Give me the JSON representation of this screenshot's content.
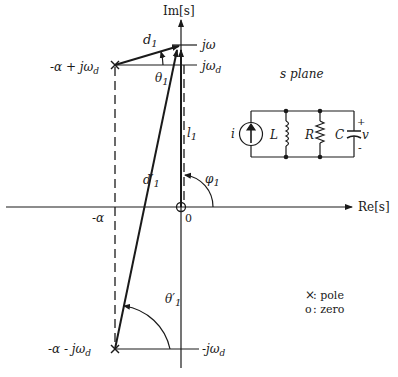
{
  "axes": {
    "imaginary_label": "Im[s]",
    "real_label": "Re[s]",
    "origin_label": "0"
  },
  "plane_title": "s plane",
  "points": {
    "j_omega": "jω",
    "j_omega_d": "jω",
    "j_omega_d_sub": "d",
    "neg_j_omega_d": "-jω",
    "neg_j_omega_d_sub": "d",
    "upper_pole": "-α + jω",
    "upper_pole_sub": "d",
    "lower_pole": "-α - jω",
    "lower_pole_sub": "d",
    "neg_alpha": "-α"
  },
  "vectors": {
    "d1": "d",
    "d1_sub": "1",
    "d1_prime": "d′",
    "d1_prime_sub": "1",
    "l1": "l",
    "l1_sub": "1"
  },
  "angles": {
    "theta1": "θ",
    "theta1_sub": "1",
    "theta1_prime": "θ′",
    "theta1_prime_sub": "1",
    "phi1": "φ",
    "phi1_sub": "1"
  },
  "circuit": {
    "source": "i",
    "inductor": "L",
    "resistor": "R",
    "capacitor": "C",
    "voltage": "v",
    "plus": "+",
    "minus": "-"
  },
  "legend": {
    "pole_symbol": "×",
    "pole_label": ": pole",
    "zero_symbol": "o",
    "zero_label": ": zero"
  }
}
